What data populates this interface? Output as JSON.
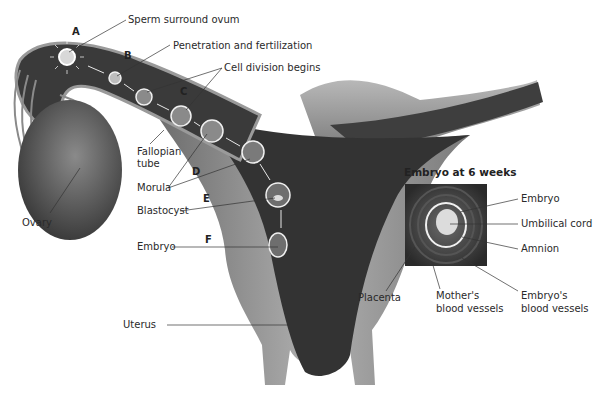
{
  "diagram": {
    "stages": [
      {
        "letter": "A",
        "label": "Sperm surround ovum"
      },
      {
        "letter": "B",
        "label": "Penetration and fertilization"
      },
      {
        "letter": "C",
        "label": "Cell division begins"
      },
      {
        "letter": "D",
        "label": "Morula"
      },
      {
        "letter": "E",
        "label": "Blastocyst"
      },
      {
        "letter": "F",
        "label": "Embryo"
      }
    ],
    "anatomy": {
      "fallopian_tube": "Fallopian\ntube",
      "fallopian_tube_line1": "Fallopian",
      "fallopian_tube_line2": "tube",
      "ovary": "Ovary",
      "uterus": "Uterus"
    },
    "inset": {
      "title": "Embryo at 6 weeks",
      "labels": {
        "embryo": "Embryo",
        "umbilical_cord": "Umbilical cord",
        "amnion": "Amnion",
        "placenta": "Placenta",
        "mothers_vessels_line1": "Mother's",
        "mothers_vessels_line2": "blood vessels",
        "embryos_vessels_line1": "Embryo's",
        "embryos_vessels_line2": "blood vessels"
      }
    },
    "colors": {
      "tissue_light": "#9a9a9a",
      "tissue_dark": "#3a3a3a",
      "lumen": "#2b2b2b",
      "cell_fill": "#8a8a8a",
      "cell_outline": "#f0f0f0"
    }
  }
}
